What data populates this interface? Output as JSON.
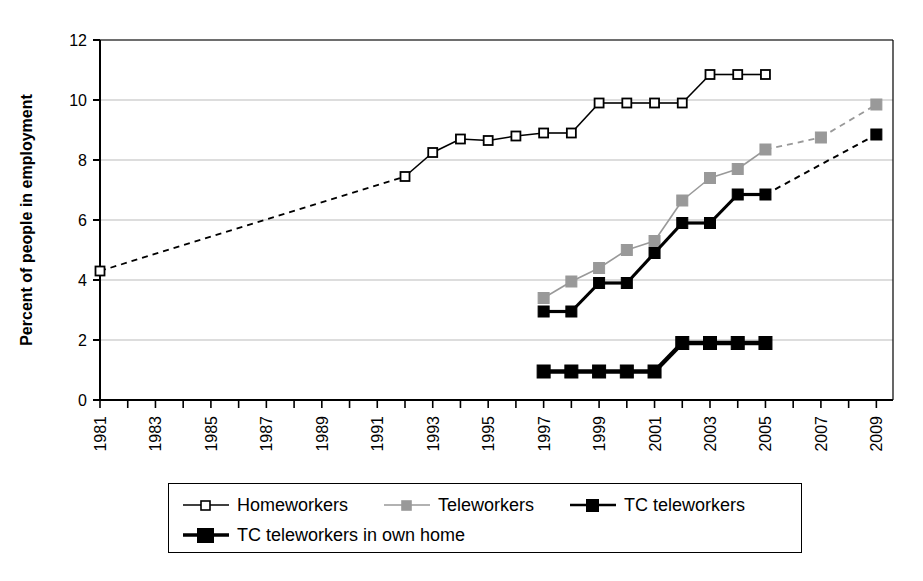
{
  "chart_data": {
    "type": "line",
    "title": "",
    "xlabel": "",
    "ylabel": "Percent of people in employment",
    "ylim": [
      0,
      12
    ],
    "ytick_values": [
      0,
      2,
      4,
      6,
      8,
      10,
      12
    ],
    "xlim": [
      1981,
      2009.6
    ],
    "xtick_labels": [
      "1981",
      "1983",
      "1985",
      "1987",
      "1989",
      "1991",
      "1993",
      "1995",
      "1997",
      "1999",
      "2001",
      "2003",
      "2005",
      "2007",
      "2009"
    ],
    "xtick_step_years": 2,
    "grid": "horizontal",
    "legend_position": "bottom",
    "series": [
      {
        "name": "Homeworkers",
        "color": "#000000",
        "marker": "open-square",
        "points": [
          {
            "x": 1981,
            "y": 4.3
          },
          {
            "x": 1992,
            "y": 7.45
          },
          {
            "x": 1993,
            "y": 8.25
          },
          {
            "x": 1994,
            "y": 8.7
          },
          {
            "x": 1995,
            "y": 8.65
          },
          {
            "x": 1996,
            "y": 8.8
          },
          {
            "x": 1997,
            "y": 8.9
          },
          {
            "x": 1998,
            "y": 8.9
          },
          {
            "x": 1999,
            "y": 9.9
          },
          {
            "x": 2000,
            "y": 9.9
          },
          {
            "x": 2001,
            "y": 9.9
          },
          {
            "x": 2002,
            "y": 9.9
          },
          {
            "x": 2003,
            "y": 10.85
          },
          {
            "x": 2004,
            "y": 10.85
          },
          {
            "x": 2005,
            "y": 10.85
          }
        ],
        "dashed_segments": [
          [
            1981,
            1992
          ]
        ]
      },
      {
        "name": "Teleworkers",
        "color": "#999999",
        "marker": "filled-square",
        "points": [
          {
            "x": 1997,
            "y": 3.4
          },
          {
            "x": 1998,
            "y": 3.95
          },
          {
            "x": 1999,
            "y": 4.4
          },
          {
            "x": 2000,
            "y": 5.0
          },
          {
            "x": 2001,
            "y": 5.3
          },
          {
            "x": 2002,
            "y": 6.65
          },
          {
            "x": 2003,
            "y": 7.4
          },
          {
            "x": 2004,
            "y": 7.7
          },
          {
            "x": 2005,
            "y": 8.35
          },
          {
            "x": 2007,
            "y": 8.75
          },
          {
            "x": 2009,
            "y": 9.85
          }
        ],
        "dashed_segments": [
          [
            2005,
            2007
          ],
          [
            2007,
            2009
          ]
        ]
      },
      {
        "name": "TC teleworkers",
        "color": "#000000",
        "marker": "filled-square",
        "points": [
          {
            "x": 1997,
            "y": 2.95
          },
          {
            "x": 1998,
            "y": 2.95
          },
          {
            "x": 1999,
            "y": 3.9
          },
          {
            "x": 2000,
            "y": 3.9
          },
          {
            "x": 2001,
            "y": 4.9
          },
          {
            "x": 2002,
            "y": 5.9
          },
          {
            "x": 2003,
            "y": 5.9
          },
          {
            "x": 2004,
            "y": 6.85
          },
          {
            "x": 2005,
            "y": 6.85
          },
          {
            "x": 2009,
            "y": 8.85
          }
        ],
        "dashed_segments": [
          [
            2005,
            2009
          ]
        ]
      },
      {
        "name": "TC teleworkers in own home",
        "color": "#000000",
        "marker": "filled-square-large",
        "points": [
          {
            "x": 1997,
            "y": 0.95
          },
          {
            "x": 1998,
            "y": 0.95
          },
          {
            "x": 1999,
            "y": 0.95
          },
          {
            "x": 2000,
            "y": 0.95
          },
          {
            "x": 2001,
            "y": 0.95
          },
          {
            "x": 2002,
            "y": 1.9
          },
          {
            "x": 2003,
            "y": 1.9
          },
          {
            "x": 2004,
            "y": 1.9
          },
          {
            "x": 2005,
            "y": 1.9
          }
        ],
        "dashed_segments": []
      }
    ]
  },
  "legend": {
    "items": [
      {
        "label": "Homeworkers"
      },
      {
        "label": "Teleworkers"
      },
      {
        "label": "TC teleworkers"
      },
      {
        "label": "TC teleworkers in own home"
      }
    ]
  },
  "axis": {
    "y_title": "Percent of people in employment"
  }
}
